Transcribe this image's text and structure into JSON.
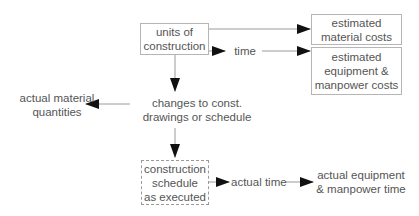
{
  "diagram": {
    "nodes": {
      "units_of_construction": {
        "lines": [
          "units of",
          "construction"
        ]
      },
      "estimated_material_costs": {
        "lines": [
          "estimated",
          "material costs"
        ]
      },
      "estimated_equipment_costs": {
        "lines": [
          "estimated",
          "equipment &",
          "manpower costs"
        ]
      },
      "time": {
        "label": "time"
      },
      "changes": {
        "lines": [
          "changes to const.",
          "drawings or schedule"
        ]
      },
      "actual_material_quantities": {
        "lines": [
          "actual material",
          "quantities"
        ]
      },
      "construction_schedule": {
        "lines": [
          "construction",
          "schedule",
          "as executed"
        ]
      },
      "actual_time": {
        "label": "actual time"
      },
      "actual_equipment_time": {
        "lines": [
          "actual equipment",
          "& manpower time"
        ]
      }
    },
    "edges": [
      {
        "from": "units of construction",
        "to": "estimated material costs"
      },
      {
        "from": "units of construction",
        "to": "time"
      },
      {
        "from": "time",
        "to": "estimated equipment & manpower costs"
      },
      {
        "from": "units of construction",
        "to": "changes to const. drawings or schedule"
      },
      {
        "from": "changes to const. drawings or schedule",
        "to": "actual material quantities"
      },
      {
        "from": "changes to const. drawings or schedule",
        "to": "construction schedule as executed"
      },
      {
        "from": "construction schedule as executed",
        "to": "actual time"
      },
      {
        "from": "actual time",
        "to": "actual equipment & manpower time"
      }
    ],
    "colors": {
      "line": "#9a9a9a",
      "arrowhead": "#111111",
      "text": "#555555",
      "box_border": "#b5b5b5"
    }
  }
}
